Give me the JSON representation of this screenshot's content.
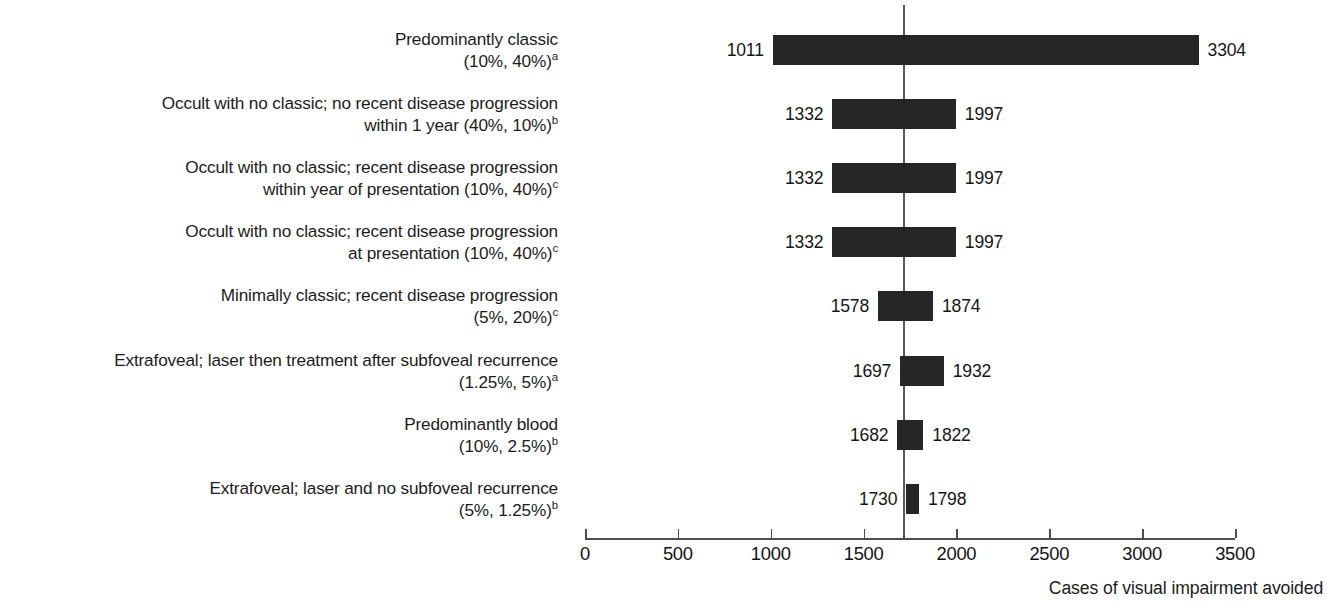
{
  "chart_data": {
    "type": "bar",
    "subtype": "range-bar",
    "title": "",
    "xlabel": "Cases of visual impairment avoided",
    "ylabel": "",
    "xlim": [
      0,
      3500
    ],
    "xticks": [
      0,
      500,
      1000,
      1500,
      2000,
      2500,
      3000,
      3500
    ],
    "xtick_labels": [
      "0",
      "500",
      "1000",
      "1500",
      "2000",
      "2500",
      "3000",
      "3500"
    ],
    "grid": false,
    "legend": null,
    "baseline_value": 1713,
    "orientation": "horizontal",
    "categories": [
      "Predominantly classic\n(10%, 40%)",
      "Occult with no classic; no recent disease progression\nwithin 1 year (40%, 10%)",
      "Occult with no classic; recent disease progression\nwithin year of presentation (10%, 40%)",
      "Occult with no classic; recent disease progression\nat presentation (10%, 40%)",
      "Minimally classic; recent disease progression\n(5%, 20%)",
      "Extrafoveal; laser then treatment after subfoveal recurrence\n(1.25%, 5%)",
      "Predominantly blood\n(10%, 2.5%)",
      "Extrafoveal; laser and no subfoveal recurrence\n(5%, 1.25%)"
    ],
    "low_values": [
      1011,
      1332,
      1332,
      1332,
      1578,
      1697,
      1682,
      1730
    ],
    "high_values": [
      3304,
      1997,
      1997,
      1997,
      1874,
      1932,
      1822,
      1798
    ]
  },
  "rows": [
    {
      "label_line1": "Predominantly classic",
      "label_line2": "(10%, 40%)",
      "footnote": "a",
      "low": 1011,
      "high": 3304,
      "low_text": "1011",
      "high_text": "3304"
    },
    {
      "label_line1": "Occult with no classic; no recent disease progression",
      "label_line2": "within 1 year (40%, 10%)",
      "footnote": "b",
      "low": 1332,
      "high": 1997,
      "low_text": "1332",
      "high_text": "1997"
    },
    {
      "label_line1": "Occult with no classic; recent disease progression",
      "label_line2": "within year of presentation (10%, 40%)",
      "footnote": "c",
      "low": 1332,
      "high": 1997,
      "low_text": "1332",
      "high_text": "1997"
    },
    {
      "label_line1": "Occult with no classic; recent disease progression",
      "label_line2": "at presentation (10%, 40%)",
      "footnote": "c",
      "low": 1332,
      "high": 1997,
      "low_text": "1332",
      "high_text": "1997"
    },
    {
      "label_line1": "Minimally classic; recent disease progression",
      "label_line2": "(5%, 20%)",
      "footnote": "c",
      "low": 1578,
      "high": 1874,
      "low_text": "1578",
      "high_text": "1874"
    },
    {
      "label_line1": "Extrafoveal; laser then treatment after subfoveal recurrence",
      "label_line2": "(1.25%, 5%)",
      "footnote": "a",
      "low": 1697,
      "high": 1932,
      "low_text": "1697",
      "high_text": "1932"
    },
    {
      "label_line1": "Predominantly blood",
      "label_line2": "(10%, 2.5%)",
      "footnote": "b",
      "low": 1682,
      "high": 1822,
      "low_text": "1682",
      "high_text": "1822"
    },
    {
      "label_line1": "Extrafoveal; laser and no subfoveal recurrence",
      "label_line2": "(5%, 1.25%)",
      "footnote": "b",
      "low": 1730,
      "high": 1798,
      "low_text": "1730",
      "high_text": "1798"
    }
  ],
  "axis": {
    "title": "Cases of visual impairment avoided",
    "ticks": [
      "0",
      "500",
      "1000",
      "1500",
      "2000",
      "2500",
      "3000",
      "3500"
    ]
  },
  "colors": {
    "bar": "#262626",
    "axis": "#4d4d4d",
    "reference_line": "#5a5a5a",
    "text": "#161616",
    "background": "#ffffff"
  }
}
